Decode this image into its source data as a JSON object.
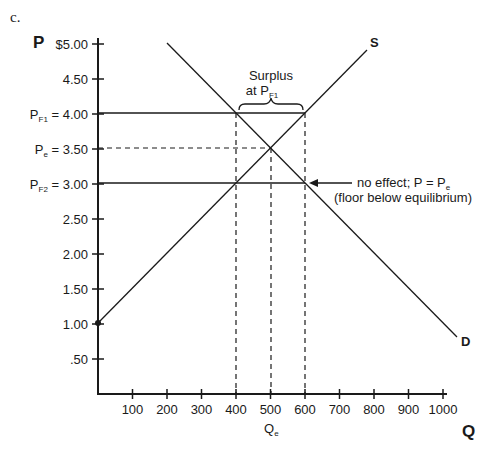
{
  "part_label": "c.",
  "axes": {
    "y_title": "P",
    "x_title": "Q",
    "y_ticks": [
      {
        "value": 5.0,
        "label": "$5.00"
      },
      {
        "value": 4.5,
        "label": "4.50"
      },
      {
        "value": 4.0,
        "label": "4.00",
        "prefix": "P",
        "sub": "F1",
        "eq": " = "
      },
      {
        "value": 3.5,
        "label": "3.50",
        "prefix": "P",
        "sub": "e",
        "eq": " = "
      },
      {
        "value": 3.0,
        "label": "3.00",
        "prefix": "P",
        "sub": "F2",
        "eq": " = "
      },
      {
        "value": 2.5,
        "label": "2.50"
      },
      {
        "value": 2.0,
        "label": "2.00"
      },
      {
        "value": 1.5,
        "label": "1.50"
      },
      {
        "value": 1.0,
        "label": "1.00"
      },
      {
        "value": 0.5,
        "label": ".50"
      }
    ],
    "x_ticks": [
      {
        "value": 100,
        "label": "100"
      },
      {
        "value": 200,
        "label": "200"
      },
      {
        "value": 300,
        "label": "300"
      },
      {
        "value": 400,
        "label": "400"
      },
      {
        "value": 500,
        "label": "500"
      },
      {
        "value": 600,
        "label": "600"
      },
      {
        "value": 700,
        "label": "700"
      },
      {
        "value": 800,
        "label": "800"
      },
      {
        "value": 900,
        "label": "900"
      },
      {
        "value": 1000,
        "label": "1000"
      }
    ],
    "qe_label": {
      "main": "Q",
      "sub": "e"
    }
  },
  "curves": {
    "supply": {
      "label": "S",
      "from": [
        0,
        1.0
      ],
      "to": [
        780,
        4.9
      ]
    },
    "demand": {
      "label": "D",
      "from": [
        200,
        5.0
      ],
      "to": [
        1040,
        0.8
      ]
    }
  },
  "annotations": {
    "surplus_line1": "Surplus",
    "surplus_line2_main": "at P",
    "surplus_line2_sub": "F1",
    "no_effect_main": "no effect; P = P",
    "no_effect_sub": "e",
    "no_effect_line2": "(floor below equilibrium)"
  },
  "chart_data": {
    "type": "line",
    "title": "",
    "xlabel": "Q",
    "ylabel": "P",
    "xlim": [
      0,
      1000
    ],
    "ylim": [
      0,
      5.0
    ],
    "series": [
      {
        "name": "S",
        "x": [
          0,
          500,
          800
        ],
        "y": [
          1.0,
          3.5,
          5.0
        ]
      },
      {
        "name": "D",
        "x": [
          200,
          500,
          1000
        ],
        "y": [
          5.0,
          3.5,
          1.0
        ]
      }
    ],
    "reference_lines": [
      {
        "name": "P_F1",
        "type": "horizontal",
        "y": 4.0,
        "style": "solid",
        "x_range": [
          0,
          600
        ]
      },
      {
        "name": "P_e",
        "type": "horizontal",
        "y": 3.5,
        "style": "dashed",
        "x_range": [
          0,
          500
        ]
      },
      {
        "name": "P_F2",
        "type": "horizontal",
        "y": 3.0,
        "style": "solid",
        "x_range": [
          0,
          600
        ]
      },
      {
        "name": "Q=400",
        "type": "vertical",
        "x": 400,
        "style": "dashed"
      },
      {
        "name": "Q_e=500",
        "type": "vertical",
        "x": 500,
        "style": "dashed"
      },
      {
        "name": "Q=600",
        "type": "vertical",
        "x": 600,
        "style": "dashed"
      }
    ],
    "equilibrium": {
      "Q": 500,
      "P": 3.5
    },
    "annotations": [
      "Surplus at P_F1 (from Q=400 to Q=600)",
      "no effect; P = P_e (floor below equilibrium)"
    ]
  }
}
